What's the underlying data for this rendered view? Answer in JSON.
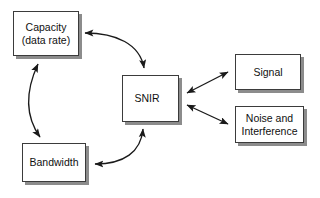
{
  "diagram": {
    "background_color": "#ffffff",
    "node_fill_color": "#ffffff",
    "node_border_color": "#3b3b3b",
    "node_shadow_color": "#8c8c8c",
    "arrow_color": "#1a1a1a",
    "nodes": [
      {
        "id": "capacity",
        "label": "Capacity\n(data rate)"
      },
      {
        "id": "bandwidth",
        "label": "Bandwidth"
      },
      {
        "id": "snir",
        "label": "SNIR"
      },
      {
        "id": "signal",
        "label": "Signal"
      },
      {
        "id": "noise",
        "label": "Noise and\nInterference"
      }
    ],
    "edges": [
      {
        "id": "capacity-snir",
        "from": "Capacity (data rate)",
        "to": "SNIR",
        "style": "curved",
        "arrowheads": "both"
      },
      {
        "id": "capacity-bandwidth",
        "from": "Capacity (data rate)",
        "to": "Bandwidth",
        "style": "curved",
        "arrowheads": "both"
      },
      {
        "id": "snir-bandwidth",
        "from": "SNIR",
        "to": "Bandwidth",
        "style": "curved",
        "arrowheads": "both"
      },
      {
        "id": "snir-signal",
        "from": "SNIR",
        "to": "Signal",
        "style": "straight",
        "arrowheads": "both"
      },
      {
        "id": "snir-noise",
        "from": "SNIR",
        "to": "Noise and Interference",
        "style": "straight",
        "arrowheads": "both"
      }
    ]
  }
}
